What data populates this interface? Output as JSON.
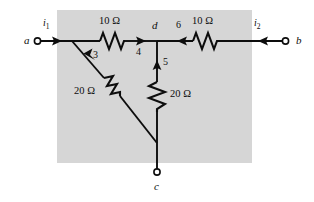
{
  "figure": {
    "type": "circuit-diagram",
    "background_color": "#ffffff",
    "panel_color": "#d6d6d6",
    "wire_color": "#0d0d0d"
  },
  "terminals": [
    {
      "name": "a",
      "label": "a",
      "x": 36,
      "y": 41
    },
    {
      "name": "b",
      "label": "b",
      "x": 287,
      "y": 41
    },
    {
      "name": "c",
      "label": "c",
      "x": 157,
      "y": 173
    }
  ],
  "nodes": [
    {
      "name": "d",
      "label": "d",
      "x": 157,
      "y": 41
    }
  ],
  "currents": [
    {
      "name": "i1",
      "label": "i",
      "subscript": "1",
      "direction": "right",
      "at": "left-terminal"
    },
    {
      "name": "i2",
      "label": "i",
      "subscript": "2",
      "direction": "left",
      "at": "right-terminal"
    },
    {
      "name": "branch-3",
      "label": "3",
      "direction": "up-left",
      "branch": "diagonal-20-ohm"
    },
    {
      "name": "branch-4",
      "label": "4",
      "direction": "right",
      "branch": "left-10-ohm"
    },
    {
      "name": "branch-5",
      "label": "5",
      "direction": "up",
      "branch": "vertical-20-ohm"
    },
    {
      "name": "branch-6",
      "label": "6",
      "direction": "left",
      "branch": "right-10-ohm"
    }
  ],
  "resistors": [
    {
      "name": "left-10-ohm",
      "label": "10 Ω",
      "value": 10,
      "unit": "Ω",
      "orientation": "horizontal"
    },
    {
      "name": "right-10-ohm",
      "label": "10 Ω",
      "value": 10,
      "unit": "Ω",
      "orientation": "horizontal"
    },
    {
      "name": "diagonal-20-ohm",
      "label": "20 Ω",
      "value": 20,
      "unit": "Ω",
      "orientation": "diagonal"
    },
    {
      "name": "vertical-20-ohm",
      "label": "20 Ω",
      "value": 20,
      "unit": "Ω",
      "orientation": "vertical"
    }
  ],
  "labels": {
    "terminal_a": "a",
    "terminal_b": "b",
    "terminal_c": "c",
    "node_d": "d",
    "current_i_base": "i",
    "current_i1_sub": "1",
    "current_i2_sub": "2",
    "current_3": "3",
    "current_4": "4",
    "current_5": "5",
    "current_6": "6",
    "res_top_left": "10 Ω",
    "res_top_right": "10 Ω",
    "res_diagonal": "20 Ω",
    "res_vertical": "20 Ω"
  }
}
